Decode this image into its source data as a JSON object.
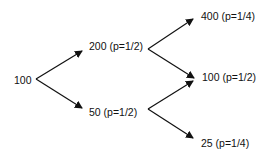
{
  "diagram": {
    "type": "binomial-tree",
    "colors": {
      "line": "#111111",
      "text": "#111111",
      "background": "#ffffff"
    },
    "nodes": {
      "root": {
        "label": "100"
      },
      "up": {
        "label": "200 (p=1/2)"
      },
      "down": {
        "label": "50 (p=1/2)"
      },
      "up_up": {
        "label": "400 (p=1/4)"
      },
      "middle": {
        "label": "100 (p=1/2)"
      },
      "down_down": {
        "label": "25 (p=1/4)"
      }
    },
    "edges": [
      {
        "from": "root",
        "to": "up"
      },
      {
        "from": "root",
        "to": "down"
      },
      {
        "from": "up",
        "to": "up_up"
      },
      {
        "from": "up",
        "to": "middle"
      },
      {
        "from": "down",
        "to": "middle"
      },
      {
        "from": "down",
        "to": "down_down"
      }
    ]
  }
}
